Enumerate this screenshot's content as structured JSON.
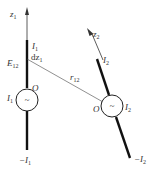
{
  "diagram": {
    "antenna1": {
      "axis_label": "z",
      "axis_sub": "1",
      "current_top": "I",
      "current_top_sub": "1",
      "element_label": "dz",
      "element_sub": "1",
      "field_label": "E",
      "field_sub": "12",
      "origin_label": "O",
      "source_label": "I",
      "source_sub": "1",
      "source_symbol": "~",
      "current_bottom": "−I",
      "current_bottom_sub": "1"
    },
    "antenna2": {
      "axis_label": "z",
      "axis_sub": "2",
      "current_top": "I",
      "current_top_sub": "2",
      "origin_label": "O",
      "source_label": "I",
      "source_sub": "2",
      "source_symbol": "~",
      "current_bottom": "−I",
      "current_bottom_sub": "2"
    },
    "distance": {
      "label": "r",
      "sub": "12"
    }
  }
}
